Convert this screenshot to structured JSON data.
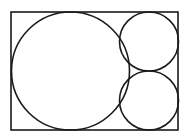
{
  "diagram": {
    "type": "geometry",
    "stroke_color": "#1a1a1a",
    "background_color": "#ffffff",
    "rectangle": {
      "x": 11,
      "y": 12,
      "width": 167,
      "height": 118
    },
    "circles": [
      {
        "name": "large-circle",
        "cx": 70.5,
        "cy": 71,
        "r": 59
      },
      {
        "name": "small-circle-top",
        "cx": 149,
        "cy": 41.5,
        "r": 29.5
      },
      {
        "name": "small-circle-bottom",
        "cx": 149,
        "cy": 100.5,
        "r": 29.5
      }
    ]
  }
}
